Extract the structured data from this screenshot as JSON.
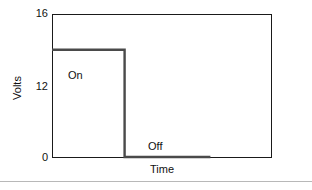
{
  "chart_data": {
    "type": "line",
    "title": "",
    "subtitle": "",
    "xlabel": "Time",
    "ylabel": "Volts",
    "ytick_labels": [
      "16",
      "12",
      "0"
    ],
    "ytick_values": [
      16,
      12,
      0
    ],
    "ylim": [
      0,
      16
    ],
    "xlim": [
      0,
      100
    ],
    "xtick_labels": [],
    "grid": false,
    "legend": false,
    "annotations": [
      {
        "text": "On",
        "x": 10,
        "y": 12,
        "placement": "above-line"
      },
      {
        "text": "Off",
        "x": 44,
        "y": 0,
        "placement": "above-line"
      }
    ],
    "series": [
      {
        "name": "Voltage",
        "color": "#4a4a4a",
        "type": "step",
        "x": [
          0,
          33,
          33,
          72
        ],
        "values": [
          12,
          12,
          0,
          0
        ],
        "points": [
          {
            "x": 0,
            "y": 12
          },
          {
            "x": 33,
            "y": 12
          },
          {
            "x": 33,
            "y": 0
          },
          {
            "x": 72,
            "y": 0
          }
        ]
      }
    ]
  },
  "axes": {
    "ticks": {
      "top": "16",
      "middle": "12",
      "bottom": "0"
    },
    "y_title": "Volts",
    "x_title": "Time"
  },
  "labels": {
    "on": "On",
    "off": "Off"
  },
  "colors": {
    "frame": "#1a1a1a",
    "trace": "#4a4a4a",
    "text": "#111111",
    "divider": "#b8b8b8",
    "background": "#ffffff"
  }
}
